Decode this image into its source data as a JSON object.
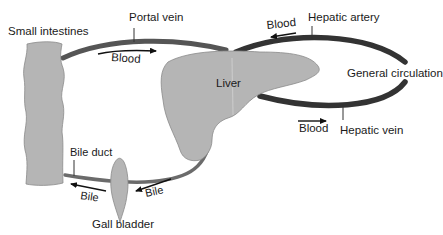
{
  "diagram": {
    "organs": {
      "small_intestines": "Small intestines",
      "liver": "Liver",
      "gall_bladder": "Gall bladder",
      "general_circulation": "General circulation"
    },
    "vessels": {
      "portal_vein": "Portal vein",
      "hepatic_artery": "Hepatic artery",
      "hepatic_vein": "Hepatic vein",
      "bile_duct": "Bile duct"
    },
    "flow_labels": {
      "portal_blood": "Blood",
      "artery_blood": "Blood",
      "vein_blood": "Blood",
      "bile_left": "Bile",
      "bile_right": "Bile"
    },
    "colors": {
      "organ_fill": "#b5b5b5",
      "vessel_dark": "#333333",
      "duct": "#6b6b6b"
    }
  }
}
